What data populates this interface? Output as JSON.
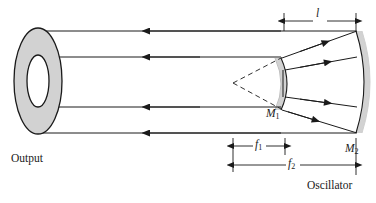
{
  "figure": {
    "background_color": "#ffffff",
    "stroke_color": "#1a1a1a",
    "mirror_fill": "#d2d2d2",
    "annulus_fill": "#d2d2d2",
    "annulus_hole_fill": "#ffffff",
    "width": 376,
    "height": 203
  },
  "labels": {
    "output": "Output",
    "oscillator": "Oscillator",
    "mirror_1": "M",
    "mirror_1_sub": "1",
    "mirror_2": "M",
    "mirror_2_sub": "2",
    "length_l": "l",
    "focal_1": "f",
    "focal_1_sub": "1",
    "focal_2": "f",
    "focal_2_sub": "2"
  },
  "dimensions": {
    "l": {
      "label": "l",
      "x_start": 284,
      "x_end": 356,
      "y": 22
    },
    "f1": {
      "label": "f1",
      "x_start": 233,
      "x_end": 285,
      "y": 146
    },
    "f2": {
      "label": "f2",
      "x_start": 233,
      "x_end": 356,
      "y": 165
    }
  },
  "beams": {
    "output_rays_y": [
      31,
      57,
      107,
      133
    ],
    "output_ray_direction": "left",
    "cavity_ray_count": 4
  },
  "elements": [
    {
      "name": "output-annulus",
      "type": "annulus",
      "cx": 38,
      "cy": 81,
      "rx": 24,
      "ry": 53
    },
    {
      "name": "mirror-m1",
      "type": "convex-mirror-arc",
      "x": 281,
      "y_top": 58,
      "y_bottom": 110
    },
    {
      "name": "mirror-m2",
      "type": "concave-mirror-arc",
      "x": 356,
      "y_top": 31,
      "y_bottom": 133
    },
    {
      "name": "focus-point",
      "type": "virtual-focus",
      "x": 233,
      "y": 83
    }
  ]
}
